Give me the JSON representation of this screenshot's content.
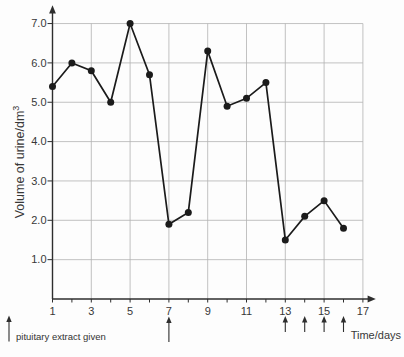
{
  "chart_data": {
    "type": "line",
    "title": "",
    "xlabel": "Time/days",
    "ylabel": "Volume of urine/dm³",
    "ylabel_base": "Volume of urine/dm",
    "ylabel_sup": "3",
    "x": [
      1,
      2,
      3,
      4,
      5,
      6,
      7,
      8,
      9,
      10,
      11,
      12,
      13,
      14,
      15,
      16
    ],
    "values": [
      5.4,
      6.0,
      5.8,
      5.0,
      7.0,
      5.7,
      1.9,
      2.2,
      6.3,
      4.9,
      5.1,
      5.5,
      1.5,
      2.1,
      2.5,
      1.8
    ],
    "xlim": [
      1,
      17
    ],
    "ylim": [
      0,
      7.4
    ],
    "x_tick_values": [
      1,
      3,
      5,
      7,
      9,
      11,
      13,
      15,
      17
    ],
    "x_tick_labels": [
      "1",
      "3",
      "5",
      "7",
      "9",
      "11",
      "13",
      "15",
      "17"
    ],
    "y_tick_values": [
      1,
      2,
      3,
      4,
      5,
      6,
      7
    ],
    "y_tick_labels": [
      "1.0",
      "2.0",
      "3.0",
      "4.0",
      "5.0",
      "6.0",
      "7.0"
    ],
    "grid": true,
    "legend_position": "bottom-left",
    "annotation": {
      "label": "pituitary extract given",
      "arrow_days": [
        7,
        13,
        14,
        15,
        16
      ],
      "arrow_sizes": [
        "long",
        "short",
        "short",
        "short",
        "short"
      ]
    },
    "colors": {
      "line": "#1b1b1b",
      "marker": "#1b1b1b",
      "grid": "#b3b3b3",
      "axis": "#2e2e2e",
      "text": "#383838"
    }
  }
}
